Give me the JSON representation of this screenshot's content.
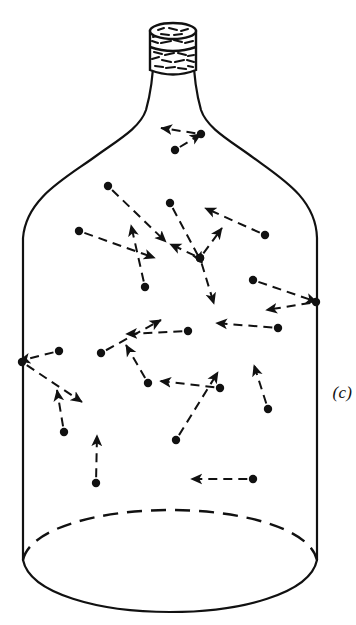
{
  "figure": {
    "label": "(c)",
    "caption_text": "(c)",
    "ink_color": "#111111",
    "background_color": "#ffffff",
    "width": 356,
    "height": 625
  },
  "bottle": {
    "name": "carboy-bottle",
    "outline_color": "#111111",
    "outline_width": 2.2,
    "body_left_x": 22,
    "body_right_x": 318,
    "body_bottom_y": 560,
    "shoulder_top_y": 150,
    "neck_left_x": 152,
    "neck_right_x": 196,
    "neck_top_y": 70,
    "base_ellipse_ry": 46,
    "base_back_dashed": true
  },
  "cork": {
    "name": "cork-stopper",
    "x": 150,
    "y": 22,
    "width": 46,
    "height": 50,
    "fill": "#ffffff",
    "stroke": "#111111",
    "texture": "stippled-cork-speckle",
    "lip_ellipse_ry": 7
  },
  "particles": {
    "count": 24,
    "dot_radius": 4.2,
    "dot_color": "#111111",
    "vector_style": "dashed-arrow",
    "vector_color": "#111111",
    "vector_width": 2,
    "dash_pattern": "9 6",
    "items": [
      {
        "id": "p01",
        "label": "particle-neck",
        "x": 175,
        "y": 150,
        "vx": 26,
        "vy": -16
      },
      {
        "id": "p02",
        "label": "particle-neck-rebound",
        "x": 201,
        "y": 134,
        "vx": -40,
        "vy": -6
      },
      {
        "id": "p03",
        "label": "particle-upper-left",
        "x": 108,
        "y": 186,
        "vx": 58,
        "vy": 56
      },
      {
        "id": "p04",
        "label": "particle-upper-mid",
        "x": 170,
        "y": 203,
        "vx": 32,
        "vy": 60
      },
      {
        "id": "p05",
        "label": "particle-upper-right",
        "x": 265,
        "y": 235,
        "vx": -60,
        "vy": -27
      },
      {
        "id": "p06",
        "label": "particle-left-mid",
        "x": 79,
        "y": 231,
        "vx": 76,
        "vy": 27
      },
      {
        "id": "p07",
        "label": "particle-left-upflow",
        "x": 145,
        "y": 287,
        "vx": -14,
        "vy": -62
      },
      {
        "id": "p08",
        "label": "particle-center-hub",
        "x": 200,
        "y": 258,
        "vx": 22,
        "vy": -30
      },
      {
        "id": "p09",
        "label": "particle-center-down",
        "x": 200,
        "y": 258,
        "vx": 14,
        "vy": 46
      },
      {
        "id": "p10",
        "label": "particle-center-left",
        "x": 200,
        "y": 258,
        "vx": -30,
        "vy": -14
      },
      {
        "id": "p11",
        "label": "particle-mid-left-up",
        "x": 101,
        "y": 353,
        "vx": 60,
        "vy": -33
      },
      {
        "id": "p12",
        "label": "particle-right-wall-in",
        "x": 253,
        "y": 280,
        "vx": 64,
        "vy": 22
      },
      {
        "id": "p13",
        "label": "particle-right-wall-out",
        "x": 316,
        "y": 302,
        "vx": -50,
        "vy": 8
      },
      {
        "id": "p14",
        "label": "particle-right-mid",
        "x": 278,
        "y": 328,
        "vx": -62,
        "vy": -5
      },
      {
        "id": "p15",
        "label": "particle-mid-center",
        "x": 188,
        "y": 331,
        "vx": -62,
        "vy": 3
      },
      {
        "id": "p16",
        "label": "particle-left-wall-in",
        "x": 59,
        "y": 351,
        "vx": -40,
        "vy": 10
      },
      {
        "id": "p17",
        "label": "particle-left-wall-out",
        "x": 22,
        "y": 362,
        "vx": 60,
        "vy": 40
      },
      {
        "id": "p18",
        "label": "particle-lower-left-up",
        "x": 64,
        "y": 432,
        "vx": -7,
        "vy": -42
      },
      {
        "id": "p19",
        "label": "particle-lower-mid-up",
        "x": 148,
        "y": 383,
        "vx": -22,
        "vy": -38
      },
      {
        "id": "p20",
        "label": "particle-lower-center",
        "x": 220,
        "y": 388,
        "vx": -60,
        "vy": -7
      },
      {
        "id": "p21",
        "label": "particle-lower-diag",
        "x": 176,
        "y": 440,
        "vx": 42,
        "vy": -68
      },
      {
        "id": "p22",
        "label": "particle-lower-right-up",
        "x": 268,
        "y": 409,
        "vx": -14,
        "vy": -44
      },
      {
        "id": "p23",
        "label": "particle-base-up",
        "x": 96,
        "y": 483,
        "vx": 1,
        "vy": -48
      },
      {
        "id": "p24",
        "label": "particle-base-left",
        "x": 253,
        "y": 479,
        "vx": -62,
        "vy": 0
      }
    ]
  }
}
